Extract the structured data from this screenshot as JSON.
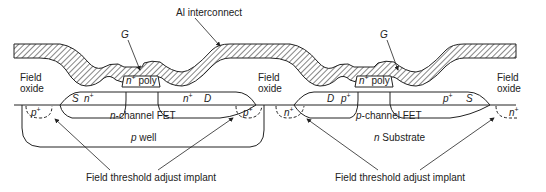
{
  "diagram": {
    "labels": {
      "al_interconnect": "Al interconnect",
      "gate_left": "G",
      "gate_right": "G",
      "field_oxide_left_1": "Field",
      "field_oxide_left_2": "oxide",
      "field_oxide_mid_1": "Field",
      "field_oxide_mid_2": "oxide",
      "field_oxide_right_1": "Field",
      "field_oxide_right_2": "oxide",
      "poly_left_n": "n",
      "poly_left_sup": "+",
      "poly_left_text": " poly",
      "poly_right_n": "n",
      "poly_right_sup": "+",
      "poly_right_text": " poly",
      "nfet_source": "S",
      "nfet_source_n": "n",
      "nfet_source_sup": "+",
      "nfet_drain_n": "n",
      "nfet_drain_sup": "+",
      "nfet_drain": "D",
      "pfet_drain": "D",
      "pfet_drain_p": "p",
      "pfet_drain_sup": "+",
      "pfet_source_p": "p",
      "pfet_source_sup": "+",
      "pfet_source": "S",
      "nfet_name_prefix": "n",
      "nfet_name": "-channel FET",
      "pfet_name_prefix": "p",
      "pfet_name": "-channel FET",
      "pwell_prefix": "p",
      "pwell": " well",
      "substrate_prefix": "n",
      "substrate": " Substrate",
      "implant_p_left": "p",
      "implant_p_left_sup": "+",
      "implant_p_right": "p",
      "implant_p_right_sup": "+",
      "implant_n_left": "n",
      "implant_n_left_sup": "+",
      "implant_n_right": "n",
      "implant_n_right_sup": "+",
      "field_threshold_left": "Field threshold adjust implant",
      "field_threshold_right": "Field threshold adjust implant"
    },
    "colors": {
      "line": "#222222",
      "hatch": "#333333",
      "background": "#ffffff"
    }
  }
}
